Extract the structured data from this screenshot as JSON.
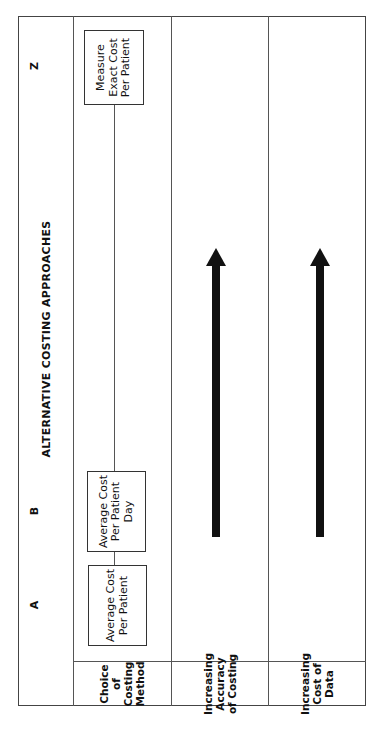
{
  "diagram": {
    "title": "ALTERNATIVE COSTING APPROACHES",
    "columns": [
      {
        "letter": "A",
        "box_label": "Average Cost Per Patient"
      },
      {
        "letter": "B",
        "box_label": "Average Cost Per Patient Day"
      },
      {
        "letter": "Z",
        "box_label": "Measure Exact Cost Per Patient"
      }
    ],
    "rows": [
      {
        "label": "Choice of Costing Method"
      },
      {
        "label": "Increasing Accuracy of Costing",
        "arrow": "right"
      },
      {
        "label": "Increasing Cost of Data",
        "arrow": "right"
      }
    ],
    "orientation": "rotated 90° counter-clockwise",
    "colors": {
      "ink": "#111111",
      "line": "#555555",
      "background": "#ffffff"
    }
  }
}
